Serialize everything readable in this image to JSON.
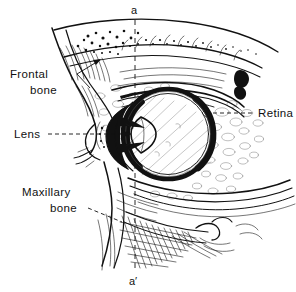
{
  "figure": {
    "kind": "anatomical-line-drawing",
    "width": 296,
    "height": 292,
    "background_color": "#ffffff",
    "ink_color": "#111111"
  },
  "axis_markers": {
    "top": "a",
    "bottom": "a′",
    "line_style": "dashed-vertical"
  },
  "labels": [
    {
      "id": "frontal-bone",
      "lines": [
        "Frontal",
        "bone"
      ],
      "align": "center",
      "leader": "arrow",
      "text_x": 10,
      "text_y": 78
    },
    {
      "id": "lens",
      "lines": [
        "Lens"
      ],
      "align": "left",
      "leader": "dashed-arrow",
      "text_x": 14,
      "text_y": 138
    },
    {
      "id": "maxillary-bone",
      "lines": [
        "Maxillary",
        "bone"
      ],
      "align": "right",
      "leader": "dashed",
      "text_x": 22,
      "text_y": 196
    },
    {
      "id": "retina",
      "lines": [
        "Retina"
      ],
      "align": "left",
      "leader": "dashed",
      "text_x": 258,
      "text_y": 117
    }
  ],
  "structures": {
    "eyeball": "globe with thick dark sclera outline",
    "lens": "biconvex lens at anterior pole",
    "cornea": "anterior dark arc",
    "retina": "inner posterior coat",
    "frontal_bone": "superior orbital roof with trabecular stipple",
    "maxillary_bone": "inferior orbital floor with cross-hatching",
    "eyelid": "upper lid with lash margin",
    "orbital_fat": "cellular stipple surrounding globe"
  },
  "colors": {
    "ink": "#111111",
    "hairline": "#1a1a1a",
    "light_hairline": "#555555",
    "paper": "#ffffff"
  }
}
